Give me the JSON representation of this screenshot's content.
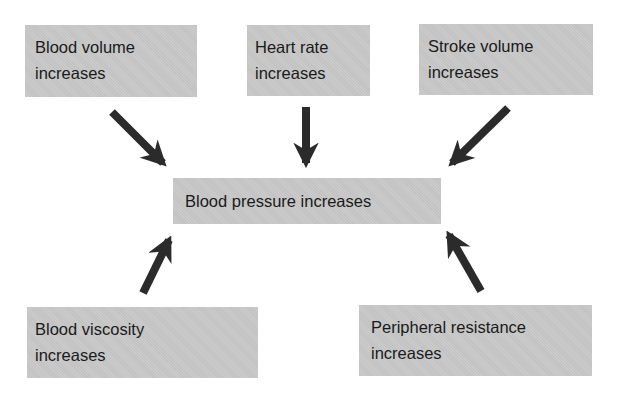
{
  "diagram": {
    "center": {
      "label": "Blood pressure increases"
    },
    "causes": [
      {
        "id": "blood-volume",
        "lines": [
          "Blood volume",
          "increases"
        ],
        "position": "top-left"
      },
      {
        "id": "heart-rate",
        "lines": [
          "Heart rate",
          "increases"
        ],
        "position": "top-center"
      },
      {
        "id": "stroke-volume",
        "lines": [
          "Stroke volume",
          "increases"
        ],
        "position": "top-right"
      },
      {
        "id": "blood-viscosity",
        "lines": [
          "Blood viscosity",
          "increases"
        ],
        "position": "bottom-left"
      },
      {
        "id": "peripheral-resistance",
        "lines": [
          "Peripheral resistance",
          "increases"
        ],
        "position": "bottom-right"
      }
    ],
    "colors": {
      "box_fill": "#c8c8c8",
      "arrow": "#2b2b2b",
      "text": "#1a1a1a",
      "background": "#ffffff"
    }
  }
}
